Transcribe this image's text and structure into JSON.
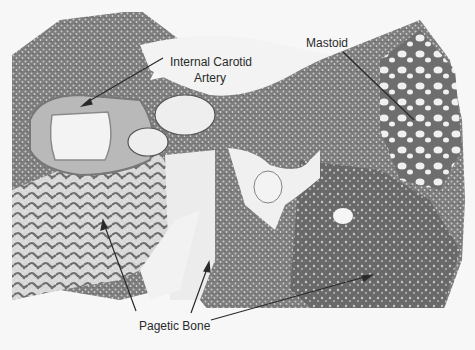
{
  "figure": {
    "type": "histology micrograph",
    "labels": {
      "internal_carotid_line1": "Internal Carotid",
      "internal_carotid_line2": "Artery",
      "mastoid": "Mastoid",
      "pagetic_bone": "Pagetic Bone"
    },
    "colors": {
      "background": "#f7f7f7",
      "tissue_dark": "#5a5a5a",
      "tissue_mid": "#8a8a8a",
      "tissue_light": "#b8b8b8",
      "space": "#f2f2f2",
      "arrow": "#2a2a2a"
    }
  }
}
